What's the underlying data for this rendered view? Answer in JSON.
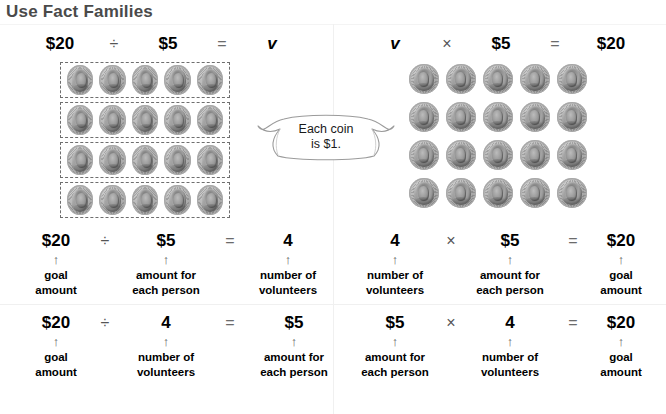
{
  "page": {
    "title": "Use Fact Families"
  },
  "callout": {
    "line1": "Each coin",
    "line2": "is $1."
  },
  "symbols": {
    "divide": "÷",
    "times": "×",
    "equals": "=",
    "arrow_up": "↑"
  },
  "panels": {
    "top_left": {
      "header": {
        "a": "$20",
        "op": "÷",
        "b": "$5",
        "eq": "=",
        "c": "v"
      },
      "coin_grid": {
        "rows": 4,
        "cols": 5,
        "boxed_rows": true,
        "total_coins": 20
      },
      "equation": {
        "a": "$20",
        "op": "÷",
        "b": "$5",
        "eq": "=",
        "c": "4",
        "label_a_1": "goal",
        "label_a_2": "amount",
        "label_b_1": "amount for",
        "label_b_2": "each person",
        "label_c_1": "number of",
        "label_c_2": "volunteers"
      }
    },
    "top_right": {
      "header": {
        "a": "v",
        "op": "×",
        "b": "$5",
        "eq": "=",
        "c": "$20"
      },
      "coin_grid": {
        "rows": 4,
        "cols": 5,
        "boxed_rows": false,
        "total_coins": 20
      },
      "equation": {
        "a": "4",
        "op": "×",
        "b": "$5",
        "eq": "=",
        "c": "$20",
        "label_a_1": "number of",
        "label_a_2": "volunteers",
        "label_b_1": "amount for",
        "label_b_2": "each person",
        "label_c_1": "goal",
        "label_c_2": "amount"
      }
    },
    "bottom_left": {
      "equation": {
        "a": "$20",
        "op": "÷",
        "b": "4",
        "eq": "=",
        "c": "$5",
        "label_a_1": "goal",
        "label_a_2": "amount",
        "label_b_1": "number of",
        "label_b_2": "volunteers",
        "label_c_1": "amount for",
        "label_c_2": "each person"
      }
    },
    "bottom_right": {
      "equation": {
        "a": "$5",
        "op": "×",
        "b": "4",
        "eq": "=",
        "c": "$20",
        "label_a_1": "amount for",
        "label_a_2": "each person",
        "label_b_1": "number of",
        "label_b_2": "volunteers",
        "label_c_1": "goal",
        "label_c_2": "amount"
      }
    }
  },
  "colors": {
    "title": "#4a4a4a",
    "text": "#000000",
    "operator": "#555555",
    "dashed_border": "#6e6e6e",
    "coin": "#a0a0a0",
    "background": "#ffffff"
  }
}
